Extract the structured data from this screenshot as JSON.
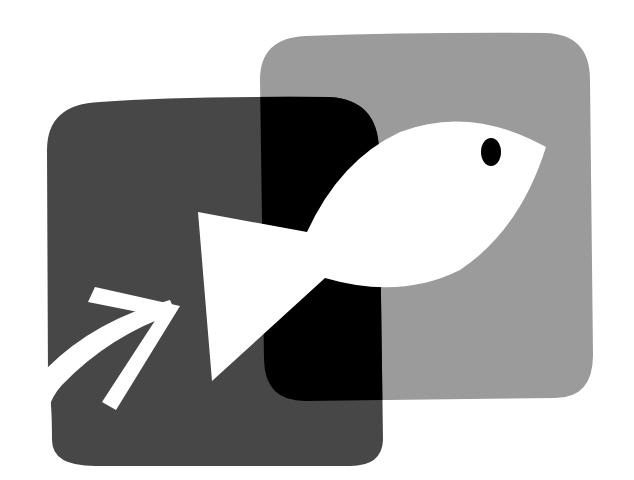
{
  "logo": {
    "description": "Two overlapping rounded squares with a white fish and an arrow",
    "colors": {
      "background": "#ffffff",
      "dark_square": "#474747",
      "light_square": "#9b9b9b",
      "overlap": "#000000",
      "fish": "#ffffff",
      "arrow": "#ffffff",
      "eye": "#000000"
    },
    "elements": [
      "dark-square",
      "light-square",
      "overlap",
      "fish",
      "fish-eye",
      "arrow"
    ]
  }
}
